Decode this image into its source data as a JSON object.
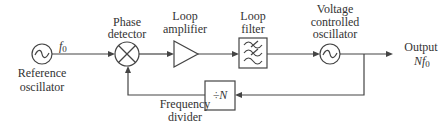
{
  "diagram": {
    "blocks": {
      "reference_oscillator": {
        "label_lines": [
          "Reference",
          "oscillator"
        ],
        "icon": "sine-wave"
      },
      "phase_detector": {
        "label_lines": [
          "Phase",
          "detector"
        ],
        "icon": "multiplier-x"
      },
      "loop_amplifier": {
        "label_lines": [
          "Loop",
          "amplifier"
        ],
        "icon": "triangle-amplifier"
      },
      "loop_filter": {
        "label_lines": [
          "Loop",
          "filter"
        ],
        "icon": "filter-waves"
      },
      "vco": {
        "label_lines": [
          "Voltage",
          "controlled",
          "oscillator"
        ],
        "icon": "sine-wave"
      },
      "frequency_divider": {
        "label_lines": [
          "Frequency",
          "divider"
        ],
        "symbol": "÷N"
      }
    },
    "signals": {
      "reference_freq": "f0",
      "reference_freq_base": "f",
      "reference_freq_sub": "0",
      "output_label": "Output",
      "output_freq_base": "Nf",
      "output_freq_sub": "0"
    },
    "colors": {
      "stroke": "#444444",
      "text": "#333333",
      "background": "#ffffff"
    }
  }
}
